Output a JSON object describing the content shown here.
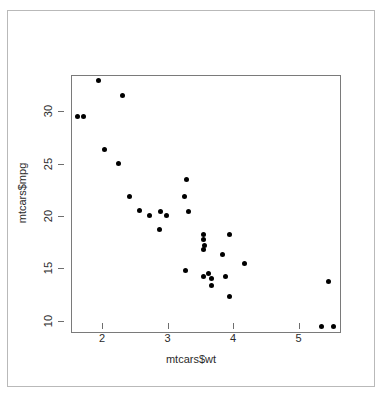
{
  "chart_data": {
    "type": "scatter",
    "title": "",
    "xlabel": "mtcars$wt",
    "ylabel": "mtcars$mpg",
    "xlim": [
      1.42,
      5.54
    ],
    "ylim": [
      9.8,
      34.4
    ],
    "xticks": [
      2,
      3,
      4,
      5
    ],
    "xtick_labels": [
      "2",
      "3",
      "4",
      "5"
    ],
    "yticks": [
      10,
      15,
      20,
      25,
      30
    ],
    "ytick_labels": [
      "10",
      "15",
      "20",
      "25",
      "30"
    ],
    "grid": false,
    "legend": false,
    "point_color": "#000000",
    "point_symbol": "filled-circle",
    "box_color": "#7a7a7a",
    "frame_color": "#b9b9b9",
    "n_points": 32,
    "x": [
      2.62,
      2.875,
      2.32,
      3.215,
      3.44,
      3.46,
      3.57,
      3.19,
      3.15,
      3.44,
      3.44,
      4.07,
      3.73,
      3.78,
      5.25,
      5.424,
      5.345,
      2.2,
      1.615,
      1.835,
      2.465,
      3.52,
      3.435,
      3.84,
      3.845,
      1.935,
      2.14,
      1.513,
      3.17,
      2.77,
      3.57,
      2.78
    ],
    "y": [
      21.0,
      21.0,
      22.8,
      21.4,
      18.7,
      18.1,
      14.3,
      24.4,
      22.8,
      19.2,
      17.8,
      16.4,
      17.3,
      15.2,
      10.4,
      10.4,
      14.7,
      32.4,
      30.4,
      33.9,
      21.5,
      15.5,
      15.2,
      13.3,
      19.2,
      27.3,
      26.0,
      30.4,
      15.8,
      19.7,
      15.0,
      21.4
    ]
  },
  "axis": {
    "xlabel": "mtcars$wt",
    "ylabel": "mtcars$mpg"
  }
}
